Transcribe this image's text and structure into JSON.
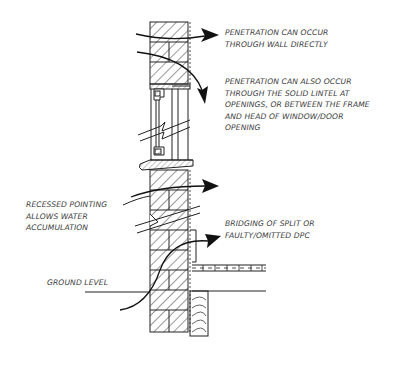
{
  "diagram": {
    "type": "section-detail",
    "colors": {
      "line": "#222222",
      "text": "#3a3a3a",
      "background": "#ffffff"
    }
  },
  "labels": {
    "wall_direct": "PENETRATION CAN OCCUR\nTHROUGH WALL DIRECTLY",
    "lintel": "PENETRATION CAN ALSO OCCUR\nTHROUGH THE SOLID LINTEL AT\nOPENINGS, OR BETWEEN THE FRAME\nAND HEAD OF WINDOW/DOOR\nOPENING",
    "recessed_pointing": "RECESSED POINTING\nALLOWS WATER\nACCUMULATION",
    "dpc": "BRIDGING OF SPLIT OR\nFAULTY/OMITTED DPC",
    "ground_level": "GROUND LEVEL"
  },
  "arrows": [
    {
      "name": "wall-direct-arrow",
      "target": "wall_direct"
    },
    {
      "name": "lintel-arrow",
      "target": "lintel"
    },
    {
      "name": "pointing-arrow",
      "target": "recessed_pointing"
    },
    {
      "name": "dpc-arrow",
      "target": "dpc"
    }
  ]
}
